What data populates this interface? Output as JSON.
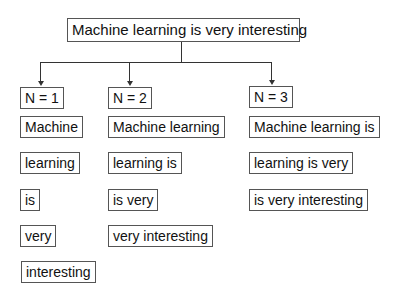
{
  "root": {
    "label": "Machine learning is very interesting"
  },
  "columns": [
    {
      "header": "N = 1",
      "items": [
        "Machine",
        "learning",
        "is",
        "very",
        "interesting"
      ]
    },
    {
      "header": "N = 2",
      "items": [
        "Machine learning",
        "learning is",
        "is very",
        "very interesting"
      ]
    },
    {
      "header": "N = 3",
      "items": [
        "Machine learning is",
        "learning is very",
        "is very interesting"
      ]
    }
  ]
}
